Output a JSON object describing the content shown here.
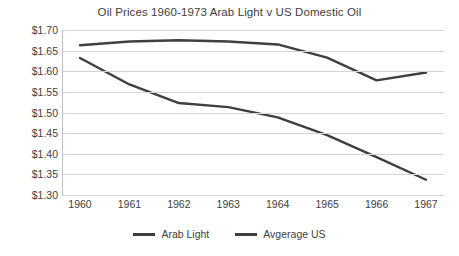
{
  "chart_data": {
    "type": "line",
    "title": "Oil Prices 1960-1973 Arab Light v US Domestic Oil",
    "xlabel": "",
    "ylabel": "",
    "categories": [
      "1960",
      "1961",
      "1962",
      "1963",
      "1964",
      "1965",
      "1966",
      "1967"
    ],
    "ylim": [
      1.3,
      1.7
    ],
    "yticks": [
      "$1.30",
      "$1.35",
      "$1.40",
      "$1.45",
      "$1.50",
      "$1.55",
      "$1.60",
      "$1.65",
      "$1.70"
    ],
    "ytick_values": [
      1.3,
      1.35,
      1.4,
      1.45,
      1.5,
      1.55,
      1.6,
      1.65,
      1.7
    ],
    "grid": true,
    "legend_position": "bottom",
    "series": [
      {
        "name": "Arab Light",
        "color": "#3f3f3f",
        "values": [
          1.663,
          1.672,
          1.675,
          1.672,
          1.665,
          1.633,
          1.578,
          1.597
        ]
      },
      {
        "name": "Avgerage US",
        "color": "#3f3f3f",
        "values": [
          1.632,
          1.568,
          1.523,
          1.513,
          1.488,
          1.445,
          1.392,
          1.337
        ]
      }
    ]
  },
  "legend": {
    "items": [
      {
        "label": "Arab Light"
      },
      {
        "label": "Avgerage US"
      }
    ]
  },
  "colors": {
    "line": "#3f3f3f",
    "grid": "#d4d4d4",
    "text": "#404040",
    "background": "#ffffff"
  }
}
